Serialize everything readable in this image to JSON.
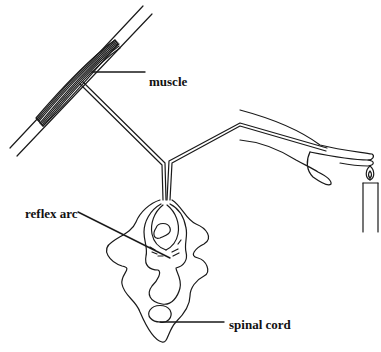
{
  "diagram": {
    "type": "reflex-arc-illustration",
    "labels": {
      "muscle": "muscle",
      "reflex_arc": "reflex arc",
      "spinal_cord": "spinal cord"
    },
    "components": [
      "muscle",
      "motor nerve",
      "sensory nerve",
      "hand",
      "candle flame",
      "spinal cord",
      "reflex arc"
    ],
    "colors": {
      "line": "#1a1a1a",
      "background": "#ffffff"
    }
  }
}
